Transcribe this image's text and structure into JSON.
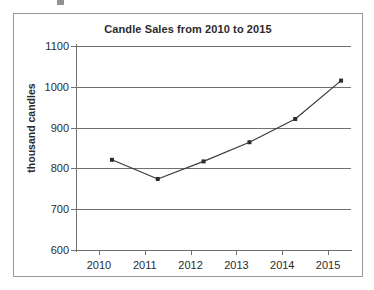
{
  "chart_data": {
    "type": "line",
    "title": "Candle Sales from 2010 to 2015",
    "xlabel": "",
    "ylabel": "thousand candles",
    "categories": [
      "2010",
      "2011",
      "2012",
      "2013",
      "2014",
      "2015"
    ],
    "x": [
      2010,
      2011,
      2012,
      2013,
      2014,
      2015
    ],
    "values": [
      853,
      806,
      849,
      896,
      953,
      1047
    ],
    "series": [
      {
        "name": "Candle sales",
        "values": [
          853,
          806,
          849,
          896,
          953,
          1047
        ]
      }
    ],
    "ylim": [
      600,
      1100
    ],
    "yticks": [
      600,
      700,
      800,
      900,
      1000,
      1100
    ],
    "ytick_labels": [
      "600",
      "700",
      "800",
      "900",
      "1000",
      "1100"
    ],
    "xtick_labels": [
      "2010",
      "2011",
      "2012",
      "2013",
      "2014",
      "2015"
    ],
    "grid": "horizontal",
    "legend": "none",
    "marker": "square",
    "line_color": "#3a3a3a",
    "marker_color": "#2b2b2b",
    "grid_color": "#707070",
    "axis_color": "#707070",
    "background_color": "#ffffff",
    "border_color": "#9a9a9a"
  }
}
